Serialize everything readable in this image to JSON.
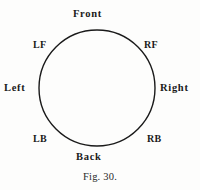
{
  "figure": {
    "caption": "Fig. 30.",
    "diagram_type": "labelled-circle",
    "line_color": "#1a1a1a",
    "background_color": "#fdfdfc",
    "text_color": "#1a1a1a"
  },
  "circle": {
    "center_x": 97,
    "center_y": 88,
    "radius": 58,
    "stroke_width": 1.4
  },
  "labels": {
    "front": "Front",
    "right_front": "RF",
    "right": "Right",
    "right_back": "RB",
    "back": "Back",
    "left_back": "LB",
    "left": "Left",
    "left_front": "LF"
  }
}
